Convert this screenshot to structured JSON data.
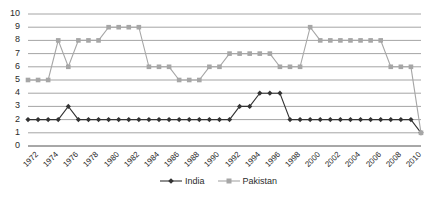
{
  "chart_data": {
    "type": "line",
    "title": "",
    "xlabel": "",
    "ylabel": "",
    "ylim": [
      0,
      10
    ],
    "ytick_labels": [
      "0",
      "1",
      "2",
      "3",
      "4",
      "5",
      "6",
      "7",
      "8",
      "9",
      "10"
    ],
    "yticks": [
      0,
      1,
      2,
      3,
      4,
      5,
      6,
      7,
      8,
      9,
      10
    ],
    "grid": "horizontal",
    "legend_position": "bottom-center",
    "xtick_labels": [
      "1972",
      "1974",
      "1976",
      "1978",
      "1980",
      "1982",
      "1984",
      "1986",
      "1988",
      "1990",
      "1992",
      "1994",
      "1996",
      "1998",
      "2000",
      "2002",
      "2004",
      "2006",
      "2008",
      "2010"
    ],
    "x": [
      1972,
      1973,
      1974,
      1975,
      1976,
      1977,
      1978,
      1979,
      1980,
      1981,
      1982,
      1983,
      1984,
      1985,
      1986,
      1987,
      1988,
      1989,
      1990,
      1991,
      1992,
      1993,
      1994,
      1995,
      1996,
      1997,
      1998,
      1999,
      2000,
      2001,
      2002,
      2003,
      2004,
      2005,
      2006,
      2007,
      2008,
      2009,
      2010,
      2011
    ],
    "series": [
      {
        "name": "India",
        "color": "#333333",
        "marker": "diamond",
        "values": [
          2,
          2,
          2,
          2,
          3,
          2,
          2,
          2,
          2,
          2,
          2,
          2,
          2,
          2,
          2,
          2,
          2,
          2,
          2,
          2,
          2,
          3,
          3,
          4,
          4,
          4,
          2,
          2,
          2,
          2,
          2,
          2,
          2,
          2,
          2,
          2,
          2,
          2,
          2,
          1
        ]
      },
      {
        "name": "Pakistan",
        "color": "#a6a6a6",
        "marker": "square",
        "values": [
          5,
          5,
          5,
          8,
          6,
          8,
          8,
          8,
          9,
          9,
          9,
          9,
          6,
          6,
          6,
          5,
          5,
          5,
          6,
          6,
          7,
          7,
          7,
          7,
          7,
          6,
          6,
          6,
          9,
          8,
          8,
          8,
          8,
          8,
          8,
          8,
          6,
          6,
          6,
          1
        ]
      }
    ]
  },
  "legend": {
    "entries": [
      {
        "label": "India"
      },
      {
        "label": "Pakistan"
      }
    ]
  }
}
